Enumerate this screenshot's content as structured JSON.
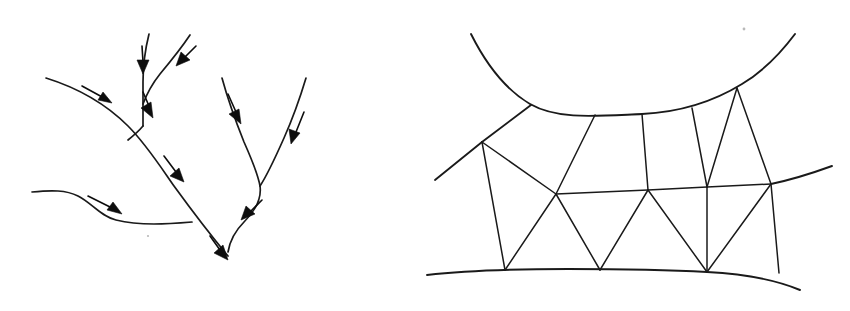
{
  "figure": {
    "width": 850,
    "height": 311,
    "background_color": "#ffffff",
    "ink_color": "#1a1a1a",
    "arrow_color": "#0d0d0d",
    "panels": [
      {
        "id": "left-panel",
        "name": "stream-network-with-flow-arrows",
        "caption": "",
        "description": "Hand-drawn dendritic channel network; solid curved lines are stream reaches and filled triangular arrowheads on short straight shafts indicate the direction of flow along each reach.",
        "arrow_count": 8,
        "reach_count": 6
      },
      {
        "id": "right-panel",
        "name": "triangular-finite-element-mesh",
        "caption": "",
        "description": "Hand-drawn domain bounded above by a concave-down curve and below by a shallow convex curve, subdivided into triangular and quadrilateral finite elements by straight interior edges.",
        "node_count": 13,
        "element_count": 12
      }
    ]
  },
  "left_panel_geometry": {
    "reaches": [
      {
        "name": "upper-main-trunk",
        "path": "M 46,78 C 78,88 106,104 128,126 C 146,144 160,166 174,186 C 190,208 208,232 228,256"
      },
      {
        "name": "north-tributary",
        "path": "M 149,34 C 145,50 143,66 143,82 C 143,98 143,112 143,126"
      },
      {
        "name": "northeast-tributary",
        "path": "M 190,35 C 180,50 170,62 160,74 C 152,84 146,96 143,104"
      },
      {
        "name": "tributary-junction-to-trunk",
        "path": "M 143,126 C 138,132 133,136 128,140"
      },
      {
        "name": "west-low-gradient-reach",
        "path": "M 32,192 C 52,190 66,190 78,196 C 92,203 100,216 116,220 C 140,226 168,224 192,222"
      },
      {
        "name": "east-branch-trunk",
        "path": "M 222,78 C 228,100 236,122 244,142 C 252,160 258,174 260,186 C 262,200 254,212 244,222 C 236,230 230,240 228,252"
      },
      {
        "name": "northeast-upper-branch",
        "path": "M 306,78 C 300,98 292,120 284,138 C 276,156 268,174 260,186"
      }
    ],
    "arrows": [
      {
        "name": "flow-arrow-upper-trunk",
        "shaft": "M 82,86 L 104,98",
        "tip": "M 112,103 L 98,100 L 103,92 Z",
        "angle_deg": 28
      },
      {
        "name": "flow-arrow-north-tributary",
        "shaft": "M 142,46 L 143,62",
        "tip": "M 143,74 L 137,60 L 149,60 Z",
        "angle_deg": 90
      },
      {
        "name": "flow-arrow-northeast-tributary",
        "shaft": "M 196,46 L 184,58",
        "tip": "M 176,66 L 181,52 L 190,60 Z",
        "angle_deg": 135
      },
      {
        "name": "flow-arrow-below-junction",
        "shaft": "M 143,92 L 149,106",
        "tip": "M 153,118 L 141,108 L 151,102 Z",
        "angle_deg": 70
      },
      {
        "name": "flow-arrow-mid-trunk",
        "shaft": "M 164,156 L 176,172",
        "tip": "M 184,182 L 170,176 L 179,168 Z",
        "angle_deg": 53
      },
      {
        "name": "flow-arrow-west-reach",
        "shaft": "M 88,196 L 112,208",
        "tip": "M 122,214 L 107,210 L 113,202 Z",
        "angle_deg": 27
      },
      {
        "name": "flow-arrow-east-branch-upper",
        "shaft": "M 228,94 L 236,112",
        "tip": "M 241,124 L 229,114 L 239,109 Z",
        "angle_deg": 66
      },
      {
        "name": "flow-arrow-northeast-branch",
        "shaft": "M 304,112 L 296,132",
        "tip": "M 291,144 L 289,129 L 300,133 Z",
        "angle_deg": 112
      },
      {
        "name": "flow-arrow-east-branch-lower",
        "shaft": "M 262,200 L 250,212",
        "tip": "M 241,220 L 246,206 L 255,214 Z",
        "angle_deg": 135
      },
      {
        "name": "flow-arrow-outlet",
        "shaft": "M 210,236 L 220,250",
        "tip": "M 228,260 L 214,253 L 223,245 Z",
        "angle_deg": 54
      }
    ],
    "specks": [
      {
        "name": "paper-speck-left",
        "cx": 148,
        "cy": 236,
        "r": 1.1
      }
    ]
  },
  "right_panel_geometry": {
    "boundaries": [
      {
        "name": "upper-boundary-curve",
        "path": "M 471,34 C 485,62 503,88 530,104 C 558,120 596,116 642,114 C 684,112 716,100 742,84 C 762,72 780,54 795,34"
      },
      {
        "name": "lower-boundary-curve",
        "path": "M 427,275 C 470,270 520,269 568,269 C 620,269 672,270 707,272 C 745,274 776,280 800,290"
      },
      {
        "name": "upper-left-boundary-ray",
        "path": "M 435,180 L 482,142"
      },
      {
        "name": "upper-left-boundary-ray-to-curve",
        "path": "M 482,142 L 531,105"
      },
      {
        "name": "right-boundary-ray",
        "path": "M 771,184 C 790,180 810,174 832,166"
      }
    ],
    "interior_edges": [
      {
        "name": "edge-left-node-to-bottom-left",
        "path": "M 482,142 L 505,270"
      },
      {
        "name": "edge-left-node-to-center-left",
        "path": "M 482,142 L 556,194"
      },
      {
        "name": "edge-curve1-to-center-left",
        "path": "M 595,115 L 556,194"
      },
      {
        "name": "edge-curve2-to-middle",
        "path": "M 642,114 L 648,190"
      },
      {
        "name": "edge-curve3-to-right-inner",
        "path": "M 692,108 L 707,187"
      },
      {
        "name": "edge-apex-to-right-inner",
        "path": "M 737,88 L 707,187"
      },
      {
        "name": "edge-apex-to-right-node",
        "path": "M 737,88 L 771,184"
      },
      {
        "name": "horizontal-center-left-to-middle",
        "path": "M 556,194 L 648,190"
      },
      {
        "name": "horizontal-middle-to-right-inner",
        "path": "M 648,190 L 707,187"
      },
      {
        "name": "horizontal-right-inner-to-right-node",
        "path": "M 707,187 L 771,184"
      },
      {
        "name": "edge-center-left-to-bottom-left",
        "path": "M 556,194 L 505,270"
      },
      {
        "name": "edge-center-left-to-bottom-mid",
        "path": "M 556,194 L 600,270"
      },
      {
        "name": "edge-middle-to-bottom-mid",
        "path": "M 648,190 L 600,270"
      },
      {
        "name": "edge-middle-to-bottom-right",
        "path": "M 648,190 L 707,272"
      },
      {
        "name": "edge-right-inner-to-bottom-right",
        "path": "M 707,187 L 707,272"
      },
      {
        "name": "edge-right-node-to-bottom-right",
        "path": "M 771,184 L 707,272"
      },
      {
        "name": "edge-right-node-to-bottom-far-right",
        "path": "M 771,184 L 779,273"
      }
    ],
    "nodes": [
      {
        "name": "node-upper-left",
        "cx": 482,
        "cy": 142
      },
      {
        "name": "node-top-curve-1",
        "cx": 595,
        "cy": 115
      },
      {
        "name": "node-top-curve-2",
        "cx": 642,
        "cy": 114
      },
      {
        "name": "node-top-curve-3",
        "cx": 692,
        "cy": 108
      },
      {
        "name": "node-top-apex",
        "cx": 737,
        "cy": 88
      },
      {
        "name": "node-center-left",
        "cx": 556,
        "cy": 194
      },
      {
        "name": "node-middle",
        "cx": 648,
        "cy": 190
      },
      {
        "name": "node-right-inner",
        "cx": 707,
        "cy": 187
      },
      {
        "name": "node-right",
        "cx": 771,
        "cy": 184
      },
      {
        "name": "node-bottom-left",
        "cx": 505,
        "cy": 270
      },
      {
        "name": "node-bottom-mid",
        "cx": 600,
        "cy": 270
      },
      {
        "name": "node-bottom-right",
        "cx": 707,
        "cy": 272
      },
      {
        "name": "node-bottom-far-right",
        "cx": 779,
        "cy": 273
      }
    ],
    "specks": [
      {
        "name": "paper-speck-right",
        "cx": 744,
        "cy": 29,
        "r": 1.4
      }
    ]
  }
}
